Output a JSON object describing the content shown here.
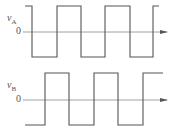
{
  "diagram": {
    "type": "timing-diagram",
    "panels": [
      {
        "id": "A",
        "signal_label": "v",
        "signal_subscript": "A",
        "zero_label": "0",
        "colors": {
          "wave": "#555555",
          "axis": "#8a8a8a"
        },
        "waveform": "square",
        "initial_level": "high",
        "transitions": [
          "fall",
          "rise",
          "fall",
          "rise",
          "fall",
          "rise"
        ]
      },
      {
        "id": "B",
        "signal_label": "v",
        "signal_subscript": "B",
        "zero_label": "0",
        "colors": {
          "wave": "#555555",
          "axis": "#8a8a8a"
        },
        "waveform": "square",
        "initial_level": "low",
        "transitions": [
          "rise",
          "fall",
          "rise",
          "fall",
          "rise"
        ]
      }
    ],
    "relation": "vB lags vA by a quarter period"
  }
}
